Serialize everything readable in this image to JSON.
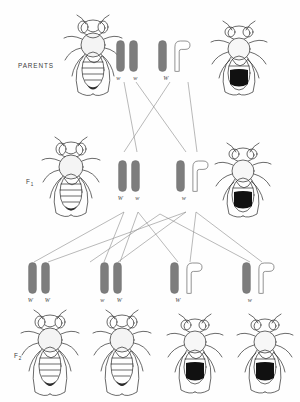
{
  "diagram": {
    "colors": {
      "chromosome_fill": "#7d7d7d",
      "chromosome_stroke": "#6f6f6f",
      "outline_fill": "#ffffff",
      "label_text": "#4a4a4a",
      "row_label_text": "#3b3b3b",
      "line": "#8a8a8a",
      "fly_ink": "#2b2b2b",
      "background": "#fefefe"
    }
  },
  "rows": {
    "parents": {
      "label": "PARENTS",
      "label_sub": "",
      "left_fly": {
        "name": "parent-female-fly",
        "sex": "female",
        "eye": "white"
      },
      "right_fly": {
        "name": "parent-male-fly",
        "sex": "male",
        "eye": "red"
      },
      "gametes": [
        {
          "name": "parents-female-chromosomes",
          "chromosomes": [
            {
              "shape": "bar",
              "label": "w"
            },
            {
              "shape": "bar",
              "label": "w"
            }
          ]
        },
        {
          "name": "parents-male-chromosomes",
          "chromosomes": [
            {
              "shape": "bar",
              "label": "W"
            },
            {
              "shape": "hook",
              "label": ""
            }
          ]
        }
      ]
    },
    "f1": {
      "label": "F",
      "label_sub": "1",
      "left_fly": {
        "name": "f1-female-fly",
        "sex": "female",
        "eye": "red"
      },
      "right_fly": {
        "name": "f1-male-fly",
        "sex": "male",
        "eye": "white"
      },
      "gametes": [
        {
          "name": "f1-female-chromosomes",
          "chromosomes": [
            {
              "shape": "bar",
              "label": "W"
            },
            {
              "shape": "bar",
              "label": "w"
            }
          ]
        },
        {
          "name": "f1-male-chromosomes",
          "chromosomes": [
            {
              "shape": "bar",
              "label": "w"
            },
            {
              "shape": "hook",
              "label": ""
            }
          ]
        }
      ]
    },
    "f2": {
      "label": "F",
      "label_sub": "2",
      "gametes": [
        {
          "name": "f2-genotype-1",
          "chromosomes": [
            {
              "shape": "bar",
              "label": "W"
            },
            {
              "shape": "bar",
              "label": "W"
            }
          ]
        },
        {
          "name": "f2-genotype-2",
          "chromosomes": [
            {
              "shape": "bar",
              "label": "w"
            },
            {
              "shape": "bar",
              "label": "W"
            }
          ]
        },
        {
          "name": "f2-genotype-3",
          "chromosomes": [
            {
              "shape": "bar",
              "label": "W"
            },
            {
              "shape": "hook",
              "label": ""
            }
          ]
        },
        {
          "name": "f2-genotype-4",
          "chromosomes": [
            {
              "shape": "bar",
              "label": "w"
            },
            {
              "shape": "hook",
              "label": ""
            }
          ]
        }
      ],
      "flies": [
        {
          "name": "f2-fly-1",
          "sex": "female",
          "eye": "red"
        },
        {
          "name": "f2-fly-2",
          "sex": "female",
          "eye": "red"
        },
        {
          "name": "f2-fly-3",
          "sex": "male",
          "eye": "red"
        },
        {
          "name": "f2-fly-4",
          "sex": "male",
          "eye": "white"
        }
      ]
    }
  }
}
